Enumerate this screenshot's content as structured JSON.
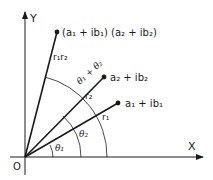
{
  "axes": {
    "x_label": "X",
    "y_label": "Y",
    "origin_label": "O"
  },
  "points": {
    "z1": {
      "label": "a₁ + ib₁"
    },
    "z2": {
      "label": "a₂ + ib₂"
    },
    "product": {
      "label": "(a₁ + ib₁) (a₂ + ib₂)"
    }
  },
  "vectors": {
    "r1": "r₁",
    "r2": "r₂",
    "r1r2": "r₁r₂"
  },
  "angles": {
    "theta1": "θ₁",
    "theta2": "θ₂",
    "theta_sum": "θ₁ + θ₂"
  },
  "colors": {
    "ink": "#1a1a1a",
    "background": "#ffffff"
  }
}
